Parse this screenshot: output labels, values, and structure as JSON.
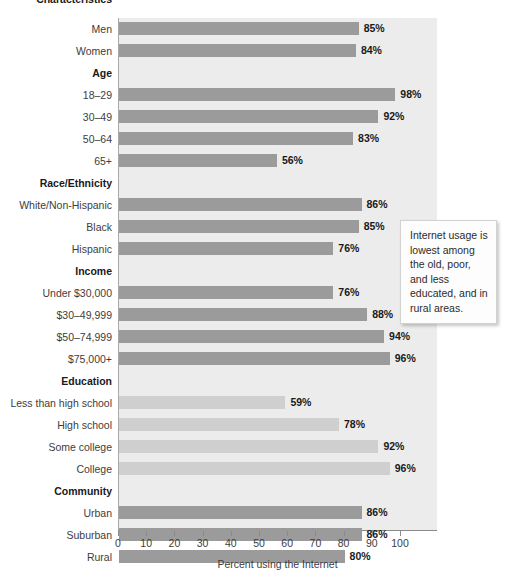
{
  "chart_data": {
    "type": "bar",
    "orientation": "horizontal",
    "title": "",
    "xlabel": "Percent using the Internet",
    "ylabel": "Characteristics",
    "xlim": [
      0,
      100
    ],
    "xticks": [
      0,
      10,
      20,
      30,
      40,
      50,
      60,
      70,
      80,
      90,
      100
    ],
    "xtick_labels": [
      "0",
      "10",
      "20",
      "30",
      "40",
      "50",
      "60",
      "70",
      "80",
      "90",
      "100"
    ],
    "grid": false,
    "legend": "none",
    "value_suffix": "%",
    "colors": {
      "bar_default": "#9b9b9b",
      "bar_highlight": "#cfcfcf",
      "plot_background": "#ececec",
      "axis_line": "#8a8a8a",
      "text": "#3d3d3d"
    },
    "header_label": "Characteristics",
    "groups": [
      {
        "name": "",
        "header": "",
        "categories": [
          "Men",
          "Women"
        ],
        "values": [
          85,
          84
        ],
        "style": "default"
      },
      {
        "name": "Age",
        "header": "Age",
        "categories": [
          "18–29",
          "30–49",
          "50–64",
          "65+"
        ],
        "values": [
          98,
          92,
          83,
          56
        ],
        "style": "default"
      },
      {
        "name": "Race/Ethnicity",
        "header": "Race/Ethnicity",
        "categories": [
          "White/Non-Hispanic",
          "Black",
          "Hispanic"
        ],
        "values": [
          86,
          85,
          76
        ],
        "style": "default"
      },
      {
        "name": "Income",
        "header": "Income",
        "categories": [
          "Under $30,000",
          "$30–49,999",
          "$50–74,999",
          "$75,000+"
        ],
        "values": [
          76,
          88,
          94,
          96
        ],
        "style": "default"
      },
      {
        "name": "Education",
        "header": "Education",
        "categories": [
          "Less than high school",
          "High school",
          "Some college",
          "College"
        ],
        "values": [
          59,
          78,
          92,
          96
        ],
        "style": "highlight"
      },
      {
        "name": "Community",
        "header": "Community",
        "categories": [
          "Urban",
          "Suburban",
          "Rural"
        ],
        "values": [
          86,
          86,
          80
        ],
        "style": "default"
      }
    ],
    "annotations": [
      {
        "id": "insight-callout",
        "text": "Internet usage is lowest among the old, poor, and less educated, and in rural areas."
      }
    ]
  }
}
